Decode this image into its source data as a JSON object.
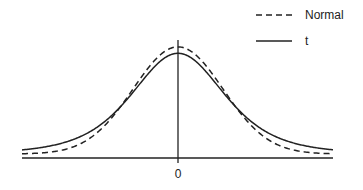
{
  "chart_data": {
    "type": "line",
    "title": "",
    "xlabel": "",
    "ylabel": "",
    "x_ticks": [
      "0"
    ],
    "grid": false,
    "legend_position": "top-right",
    "legend": [
      "Normal",
      "t"
    ],
    "series": [
      {
        "name": "Normal",
        "style": "dashed",
        "color": "#222222",
        "distribution": "standard normal density",
        "peak_relative": 1.0
      },
      {
        "name": "t",
        "style": "solid",
        "color": "#222222",
        "distribution": "Student t density (heavier tails, lower peak)",
        "peak_relative": 0.93
      }
    ],
    "annotations": [
      "Vertical line at x = 0"
    ]
  },
  "legend": {
    "normal_label": "Normal",
    "t_label": "t"
  },
  "axis": {
    "zero_label": "0"
  }
}
